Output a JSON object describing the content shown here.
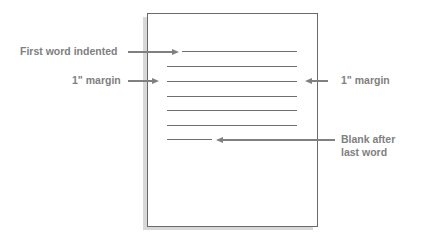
{
  "diagram": {
    "labels": {
      "first_word": "First word indented",
      "margin_left": "1\" margin",
      "margin_right": "1\" margin",
      "blank_line1": "Blank after",
      "blank_line2": "last word"
    },
    "page": {
      "text_lines": 7,
      "line_color": "#6e6e6e",
      "label_color": "#808080"
    }
  }
}
